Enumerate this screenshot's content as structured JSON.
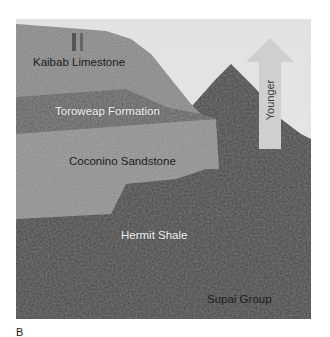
{
  "figure": {
    "panel_letter": "B",
    "labels": [
      {
        "text": "Kaibab Limestone",
        "tone": "dark"
      },
      {
        "text": "Toroweap Formation",
        "tone": "light"
      },
      {
        "text": "Coconino Sandstone",
        "tone": "dark"
      },
      {
        "text": "Hermit Shale",
        "tone": "light"
      },
      {
        "text": "Supai Group",
        "tone": "dark"
      }
    ],
    "arrow": {
      "label": "Younger",
      "direction": "up",
      "icon": "up-arrow-icon",
      "color": "#c9c9c9"
    }
  }
}
